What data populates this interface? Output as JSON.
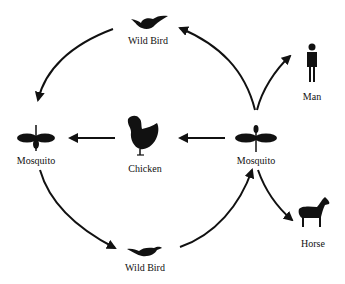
{
  "diagram": {
    "type": "transmission-cycle",
    "nodes": [
      {
        "id": "wild_bird_top",
        "label": "Wild Bird",
        "icon": "bird-icon"
      },
      {
        "id": "mosquito_left",
        "label": "Mosquito",
        "icon": "mosquito-icon"
      },
      {
        "id": "chicken",
        "label": "Chicken",
        "icon": "chicken-icon"
      },
      {
        "id": "mosquito_right",
        "label": "Mosquito",
        "icon": "mosquito-icon"
      },
      {
        "id": "man",
        "label": "Man",
        "icon": "man-icon"
      },
      {
        "id": "horse",
        "label": "Horse",
        "icon": "horse-icon"
      },
      {
        "id": "wild_bird_bottom",
        "label": "Wild Bird",
        "icon": "bird-icon"
      }
    ],
    "edges": [
      {
        "from": "wild_bird_top",
        "to": "mosquito_left"
      },
      {
        "from": "chicken",
        "to": "mosquito_left"
      },
      {
        "from": "mosquito_right",
        "to": "chicken"
      },
      {
        "from": "mosquito_right",
        "to": "wild_bird_top"
      },
      {
        "from": "mosquito_right",
        "to": "man"
      },
      {
        "from": "mosquito_right",
        "to": "horse"
      },
      {
        "from": "mosquito_left",
        "to": "wild_bird_bottom"
      },
      {
        "from": "wild_bird_bottom",
        "to": "mosquito_right"
      }
    ],
    "colors": {
      "ink": "#111111",
      "background": "#ffffff"
    }
  }
}
